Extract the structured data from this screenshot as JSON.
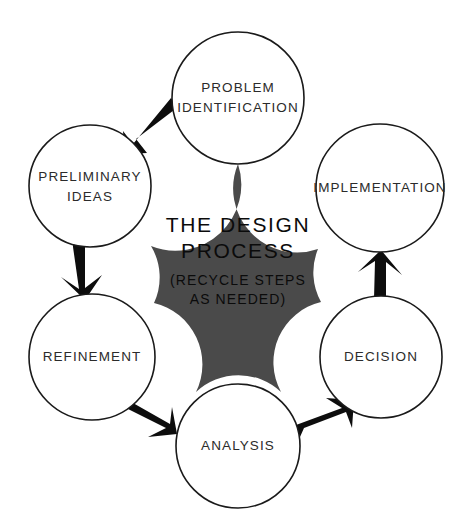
{
  "diagram": {
    "title": "THE DESIGN PROCESS",
    "subtitle_lines": [
      "(RECYCLE STEPS",
      "AS NEEDED)"
    ],
    "hub_color": "#4a4a4a",
    "node_fill": "#ffffff",
    "node_stroke": "#1a1a1a",
    "arrow_color": "#0d0d0d",
    "background": "#ffffff",
    "nodes": [
      {
        "id": "problem-identification",
        "lines": [
          "PROBLEM",
          "IDENTIFICATION"
        ],
        "cx": 238,
        "cy": 98,
        "r": 66
      },
      {
        "id": "implementation",
        "lines": [
          "IMPLEMENTATION"
        ],
        "cx": 380,
        "cy": 188,
        "r": 64
      },
      {
        "id": "decision",
        "lines": [
          "DECISION"
        ],
        "cx": 381,
        "cy": 357,
        "r": 61
      },
      {
        "id": "analysis",
        "lines": [
          "ANALYSIS"
        ],
        "cx": 238,
        "cy": 446,
        "r": 62
      },
      {
        "id": "refinement",
        "lines": [
          "REFINEMENT"
        ],
        "cx": 92,
        "cy": 357,
        "r": 63
      },
      {
        "id": "preliminary-ideas",
        "lines": [
          "PRELIMINARY",
          "IDEAS"
        ],
        "cx": 90,
        "cy": 186,
        "r": 61
      }
    ],
    "arrows": [
      {
        "id": "problem-to-preliminary",
        "from": "problem-identification",
        "to": "preliminary-ideas",
        "direction": "down-left"
      },
      {
        "id": "preliminary-to-refinement",
        "from": "preliminary-ideas",
        "to": "refinement",
        "direction": "down"
      },
      {
        "id": "refinement-to-analysis",
        "from": "refinement",
        "to": "analysis",
        "direction": "down-right"
      },
      {
        "id": "analysis-to-decision",
        "from": "analysis",
        "to": "decision",
        "direction": "up-right"
      },
      {
        "id": "decision-to-implementation",
        "from": "decision",
        "to": "implementation",
        "direction": "up"
      }
    ]
  }
}
